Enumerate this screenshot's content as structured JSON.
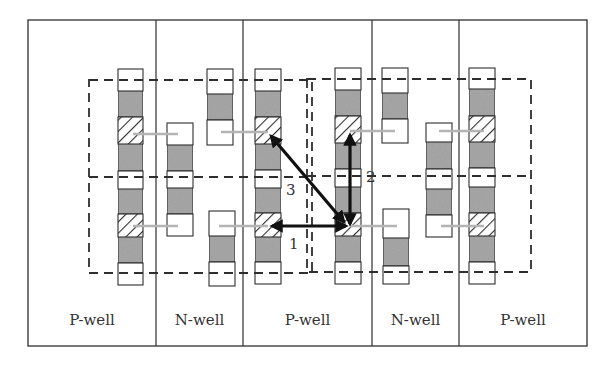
{
  "figure": {
    "outer": {
      "x": 28,
      "y": 20,
      "w": 559,
      "h": 326
    },
    "colors": {
      "stroke": "#2e2e2e",
      "gray_fill": "#a8a8a8",
      "white_fill": "#ffffff",
      "gate_line": "#b4b4b4",
      "arrow": "#111111"
    },
    "wells": [
      {
        "label": "P-well",
        "x0": 28,
        "x1": 156
      },
      {
        "label": "N-well",
        "x0": 156,
        "x1": 243
      },
      {
        "label": "P-well",
        "x0": 243,
        "x1": 372
      },
      {
        "label": "N-well",
        "x0": 372,
        "x1": 459
      },
      {
        "label": "P-well",
        "x0": 459,
        "x1": 587
      }
    ],
    "well_label_y": 325,
    "dashed_boxes": [
      {
        "name": "left-cell-box",
        "x": 89,
        "y": 80,
        "w": 223,
        "h": 193,
        "mid_y": 177
      },
      {
        "name": "right-cell-box",
        "x": 307,
        "y": 79,
        "w": 224,
        "h": 193,
        "mid_y": 176
      }
    ],
    "stacks": [
      {
        "name": "p-stack-1",
        "x": 118,
        "w": 25,
        "segments": [
          {
            "t": "white",
            "y0": 69,
            "y1": 91
          },
          {
            "t": "gray",
            "y0": 91,
            "y1": 117
          },
          {
            "t": "hatch",
            "y0": 117,
            "y1": 144
          },
          {
            "t": "gray",
            "y0": 144,
            "y1": 171
          },
          {
            "t": "white",
            "y0": 171,
            "y1": 189
          },
          {
            "t": "gray",
            "y0": 189,
            "y1": 214
          },
          {
            "t": "hatch",
            "y0": 214,
            "y1": 237
          },
          {
            "t": "gray",
            "y0": 237,
            "y1": 263
          },
          {
            "t": "white",
            "y0": 263,
            "y1": 285
          }
        ]
      },
      {
        "name": "n-stack-1",
        "x": 167,
        "w": 26,
        "segments": [
          {
            "t": "white",
            "y0": 123,
            "y1": 145
          },
          {
            "t": "gray",
            "y0": 145,
            "y1": 171
          },
          {
            "t": "white",
            "y0": 171,
            "y1": 188
          },
          {
            "t": "gray",
            "y0": 188,
            "y1": 214
          },
          {
            "t": "white",
            "y0": 214,
            "y1": 236
          }
        ]
      },
      {
        "name": "n-stack-2-top",
        "x": 207,
        "w": 26,
        "segments": [
          {
            "t": "white",
            "y0": 69,
            "y1": 94
          },
          {
            "t": "gray",
            "y0": 94,
            "y1": 120
          },
          {
            "t": "white",
            "y0": 120,
            "y1": 145
          }
        ]
      },
      {
        "name": "n-stack-2-bottom",
        "x": 209,
        "w": 26,
        "segments": [
          {
            "t": "white",
            "y0": 211,
            "y1": 236
          },
          {
            "t": "gray",
            "y0": 236,
            "y1": 262
          },
          {
            "t": "white",
            "y0": 262,
            "y1": 286
          }
        ]
      },
      {
        "name": "p-stack-2",
        "x": 255,
        "w": 26,
        "segments": [
          {
            "t": "white",
            "y0": 69,
            "y1": 91
          },
          {
            "t": "gray",
            "y0": 91,
            "y1": 117
          },
          {
            "t": "hatch",
            "y0": 117,
            "y1": 144
          },
          {
            "t": "gray",
            "y0": 144,
            "y1": 170
          },
          {
            "t": "white",
            "y0": 170,
            "y1": 188
          },
          {
            "t": "gray",
            "y0": 188,
            "y1": 213
          },
          {
            "t": "hatch",
            "y0": 213,
            "y1": 237
          },
          {
            "t": "gray",
            "y0": 237,
            "y1": 262
          },
          {
            "t": "white",
            "y0": 262,
            "y1": 284
          }
        ]
      },
      {
        "name": "p-stack-3",
        "x": 335,
        "w": 26,
        "segments": [
          {
            "t": "white",
            "y0": 68,
            "y1": 90
          },
          {
            "t": "gray",
            "y0": 90,
            "y1": 116
          },
          {
            "t": "hatch",
            "y0": 116,
            "y1": 143
          },
          {
            "t": "gray",
            "y0": 143,
            "y1": 169
          },
          {
            "t": "white",
            "y0": 169,
            "y1": 187
          },
          {
            "t": "gray",
            "y0": 187,
            "y1": 213
          },
          {
            "t": "hatch",
            "y0": 213,
            "y1": 236
          },
          {
            "t": "gray",
            "y0": 236,
            "y1": 262
          },
          {
            "t": "white",
            "y0": 262,
            "y1": 284
          }
        ]
      },
      {
        "name": "n-stack-3-top",
        "x": 382,
        "w": 26,
        "segments": [
          {
            "t": "white",
            "y0": 68,
            "y1": 93
          },
          {
            "t": "gray",
            "y0": 93,
            "y1": 119
          },
          {
            "t": "white",
            "y0": 119,
            "y1": 143
          }
        ]
      },
      {
        "name": "n-stack-3-bottom",
        "x": 383,
        "w": 26,
        "segments": [
          {
            "t": "white",
            "y0": 209,
            "y1": 238
          },
          {
            "t": "gray",
            "y0": 238,
            "y1": 266
          },
          {
            "t": "white",
            "y0": 266,
            "y1": 284
          }
        ]
      },
      {
        "name": "n-stack-4",
        "x": 426,
        "w": 26,
        "segments": [
          {
            "t": "white",
            "y0": 123,
            "y1": 142
          },
          {
            "t": "gray",
            "y0": 142,
            "y1": 169
          },
          {
            "t": "white",
            "y0": 169,
            "y1": 189
          },
          {
            "t": "gray",
            "y0": 189,
            "y1": 215
          },
          {
            "t": "white",
            "y0": 215,
            "y1": 237
          }
        ]
      },
      {
        "name": "p-stack-4",
        "x": 469,
        "w": 26,
        "segments": [
          {
            "t": "white",
            "y0": 68,
            "y1": 89
          },
          {
            "t": "gray",
            "y0": 89,
            "y1": 116
          },
          {
            "t": "hatch",
            "y0": 116,
            "y1": 142
          },
          {
            "t": "gray",
            "y0": 142,
            "y1": 168
          },
          {
            "t": "white",
            "y0": 168,
            "y1": 187
          },
          {
            "t": "gray",
            "y0": 187,
            "y1": 213
          },
          {
            "t": "hatch",
            "y0": 213,
            "y1": 236
          },
          {
            "t": "gray",
            "y0": 236,
            "y1": 262
          },
          {
            "t": "white",
            "y0": 262,
            "y1": 284
          }
        ]
      }
    ],
    "gate_lines": [
      {
        "x0": 133,
        "x1": 178,
        "y": 134
      },
      {
        "x0": 133,
        "x1": 178,
        "y": 226
      },
      {
        "x0": 221,
        "x1": 268,
        "y": 132
      },
      {
        "x0": 219,
        "x1": 268,
        "y": 226
      },
      {
        "x0": 350,
        "x1": 395,
        "y": 131
      },
      {
        "x0": 350,
        "x1": 397,
        "y": 226
      },
      {
        "x0": 439,
        "x1": 484,
        "y": 131
      },
      {
        "x0": 441,
        "x1": 484,
        "y": 226
      }
    ],
    "arrows": [
      {
        "id": "1",
        "label": "1",
        "x0": 346,
        "y0": 226,
        "x1": 272,
        "y1": 226,
        "label_x": 289,
        "label_y": 249
      },
      {
        "id": "2",
        "label": "2",
        "x0": 350,
        "y0": 224,
        "x1": 350,
        "y1": 135,
        "label_x": 366,
        "label_y": 182
      },
      {
        "id": "3",
        "label": "3",
        "x0": 344,
        "y0": 222,
        "x1": 271,
        "y1": 136,
        "label_x": 286,
        "label_y": 195
      }
    ]
  }
}
